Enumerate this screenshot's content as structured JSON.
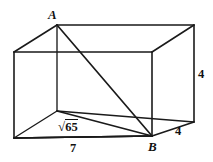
{
  "figure": {
    "kind": "rectangular-box-diagram",
    "stroke_color": "#1a1a1a",
    "background_color": "#ffffff",
    "vertices": [
      {
        "name": "back-top-left",
        "label": "A",
        "x": 57,
        "y": 25
      },
      {
        "name": "back-top-right",
        "label": "",
        "x": 194,
        "y": 25
      },
      {
        "name": "front-top-left",
        "label": "",
        "x": 14,
        "y": 52
      },
      {
        "name": "front-top-right",
        "label": "",
        "x": 152,
        "y": 52
      },
      {
        "name": "back-bottom-left",
        "label": "",
        "x": 57,
        "y": 111
      },
      {
        "name": "back-bottom-right",
        "label": "",
        "x": 194,
        "y": 122
      },
      {
        "name": "front-bottom-left",
        "label": "",
        "x": 14,
        "y": 138
      },
      {
        "name": "front-bottom-right",
        "label": "B",
        "x": 152,
        "y": 136
      }
    ],
    "labels": {
      "point_a": "A",
      "point_b": "B",
      "height_right": "4",
      "depth_bottom_right": "4",
      "width_bottom": "7",
      "base_diagonal_radical": "√",
      "base_diagonal_radicand": "65",
      "base_diagonal_full": "√65"
    }
  }
}
